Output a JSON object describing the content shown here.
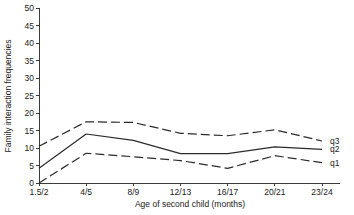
{
  "chart_data": {
    "type": "line",
    "title": "",
    "xlabel": "Age of second child (months)",
    "ylabel": "Family interaction frequencies",
    "categories": [
      "1.5/2",
      "4/5",
      "8/9",
      "12/13",
      "16/17",
      "20/21",
      "23/24"
    ],
    "xlim": [
      0,
      6
    ],
    "ylim": [
      0,
      50
    ],
    "yticks": [
      0,
      5,
      10,
      15,
      20,
      25,
      30,
      35,
      40,
      45,
      50
    ],
    "ytick_labels": [
      "0",
      "5",
      "10",
      "15",
      "20",
      "25",
      "30",
      "35",
      "40",
      "45",
      "50"
    ],
    "grid": false,
    "legend_position": "right-inline",
    "series": [
      {
        "name": "q3",
        "label": "q3",
        "style": "dashed",
        "color": "#2b2b2b",
        "values": [
          10.5,
          17.5,
          17.3,
          14.2,
          13.5,
          15.2,
          12.0
        ]
      },
      {
        "name": "q2",
        "label": "q2",
        "style": "solid",
        "color": "#2b2b2b",
        "values": [
          4.2,
          14.0,
          12.2,
          8.4,
          8.4,
          10.3,
          9.6
        ]
      },
      {
        "name": "q1",
        "label": "q1",
        "style": "dashed",
        "color": "#2b2b2b",
        "values": [
          0.0,
          8.5,
          7.5,
          6.4,
          4.2,
          7.8,
          5.8
        ]
      }
    ]
  },
  "axes": {
    "y_title": "Family interaction frequencies",
    "x_title": "Age of second child (months)"
  }
}
